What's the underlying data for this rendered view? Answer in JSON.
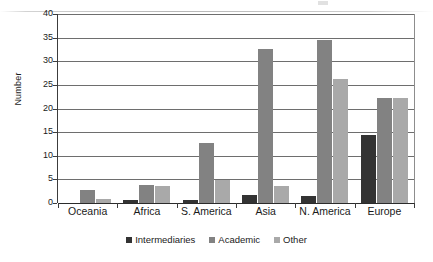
{
  "chart_data": {
    "type": "bar",
    "title": "",
    "subtitle": "",
    "xlabel": "",
    "ylabel": "Number",
    "ylim": [
      0,
      40
    ],
    "yticks": [
      0,
      5,
      10,
      15,
      20,
      25,
      30,
      35,
      40
    ],
    "grid": true,
    "legend_position": "bottom",
    "categories": [
      "Oceania",
      "Africa",
      "S. America",
      "Asia",
      "N. America",
      "Europe"
    ],
    "series": [
      {
        "name": "Intermediaries",
        "color": "#333333",
        "values": [
          0,
          0.7,
          0.6,
          1.6,
          1.5,
          14.4
        ]
      },
      {
        "name": "Academic",
        "color": "#828282",
        "values": [
          2.8,
          3.8,
          12.6,
          32.6,
          34.6,
          22.3
        ]
      },
      {
        "name": "Other",
        "color": "#a9a9a9",
        "values": [
          0.8,
          3.7,
          4.8,
          3.5,
          26.3,
          22.3
        ]
      }
    ]
  },
  "legend": {
    "items": [
      {
        "label": "Intermediaries",
        "color": "#333333"
      },
      {
        "label": "Academic",
        "color": "#828282"
      },
      {
        "label": "Other",
        "color": "#a9a9a9"
      }
    ]
  }
}
